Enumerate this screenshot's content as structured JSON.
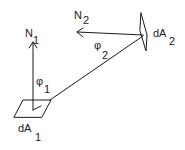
{
  "diagram": {
    "title": "",
    "surfaces": [
      {
        "id": "dA1",
        "label": "dA",
        "subscript": "1"
      },
      {
        "id": "dA2",
        "label": "dA",
        "subscript": "2"
      }
    ],
    "normals": [
      {
        "id": "N1",
        "label": "N",
        "subscript": "1"
      },
      {
        "id": "N2",
        "label": "N",
        "subscript": "2"
      }
    ],
    "angles": [
      {
        "id": "phi1",
        "label": "φ",
        "subscript": "1"
      },
      {
        "id": "phi2",
        "label": "φ",
        "subscript": "2"
      }
    ],
    "connecting_line": "line joining dA1 and dA2",
    "stroke_color": "#1a1a1a",
    "background": "#ffffff"
  }
}
